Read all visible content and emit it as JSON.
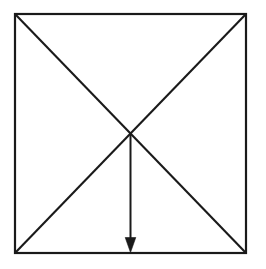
{
  "figure": {
    "background_color": "#ffffff",
    "stroke_color": "#1a1a1a",
    "canvas": {
      "width": 266,
      "height": 269
    },
    "square": {
      "name": "outer-square",
      "left": 15,
      "top": 14,
      "right": 246,
      "bottom": 253,
      "width": 231,
      "height": 239,
      "stroke_width": 2.2,
      "fill": "none"
    },
    "corners": {
      "top_left": {
        "x": 15,
        "y": 14
      },
      "top_right": {
        "x": 246,
        "y": 14
      },
      "bottom_right": {
        "x": 246,
        "y": 253
      },
      "bottom_left": {
        "x": 15,
        "y": 253
      }
    },
    "diagonals": [
      {
        "name": "diagonal-top-left-to-bottom-right",
        "x1": 15,
        "y1": 14,
        "x2": 246,
        "y2": 253,
        "stroke_width": 2.1
      },
      {
        "name": "diagonal-top-right-to-bottom-left",
        "x1": 246,
        "y1": 14,
        "x2": 15,
        "y2": 253,
        "stroke_width": 2.1
      }
    ],
    "center_point": {
      "x": 130.5,
      "y": 133.5
    },
    "arrow": {
      "name": "downward-arrow",
      "direction": "down",
      "shaft": {
        "x1": 130.5,
        "y1": 133.5,
        "x2": 130.5,
        "y2": 240,
        "stroke_width": 2.0
      },
      "head": {
        "tip_x": 130.5,
        "tip_y": 252.5,
        "left_x": 125.2,
        "right_x": 135.8,
        "base_y": 237.5,
        "width": 10.6,
        "height": 15,
        "fill": "#1a1a1a"
      }
    }
  }
}
